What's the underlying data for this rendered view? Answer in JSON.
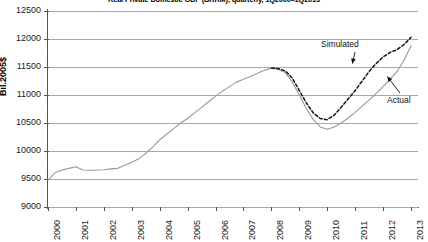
{
  "chart_data": {
    "type": "line",
    "title": "Real Private Domestic GDP (BRRM), quarterly, 1Q2000–1Q2013",
    "xlabel": "",
    "ylabel": "Bil.2005$",
    "ylim": [
      9000,
      12500
    ],
    "xlim": [
      2000,
      2013.25
    ],
    "yticks": [
      9000,
      9500,
      10000,
      10500,
      11000,
      11500,
      12000,
      12500
    ],
    "ytick_labels": [
      "9000",
      "9500",
      "10000",
      "10500",
      "11000",
      "11500",
      "12000",
      "12500"
    ],
    "xticks": [
      2000,
      2001,
      2002,
      2003,
      2004,
      2005,
      2006,
      2007,
      2008,
      2009,
      2010,
      2011,
      2012,
      2013
    ],
    "xtick_labels": [
      "2000",
      "2001",
      "2002",
      "2003",
      "2004",
      "2005",
      "2006",
      "2007",
      "2008",
      "2009",
      "2010",
      "2011",
      "2012",
      "2013"
    ],
    "grid": "horizontal",
    "legend_position": "inline-annotations",
    "annotations": [
      {
        "text": "Simulated",
        "x": 2010.3,
        "y": 12050,
        "points_to": {
          "x": 2010.9,
          "y": 11560
        }
      },
      {
        "text": "Actual",
        "x": 2012.6,
        "y": 10960,
        "points_to": {
          "x": 2012.15,
          "y": 11330
        }
      }
    ],
    "series": [
      {
        "name": "Actual",
        "style": "solid",
        "color": "#9a9a9a",
        "x": [
          2000.0,
          2000.25,
          2000.5,
          2000.75,
          2001.0,
          2001.25,
          2001.5,
          2001.75,
          2002.0,
          2002.25,
          2002.5,
          2002.75,
          2003.0,
          2003.25,
          2003.5,
          2003.75,
          2004.0,
          2004.25,
          2004.5,
          2004.75,
          2005.0,
          2005.25,
          2005.5,
          2005.75,
          2006.0,
          2006.25,
          2006.5,
          2006.75,
          2007.0,
          2007.25,
          2007.5,
          2007.75,
          2008.0,
          2008.25,
          2008.5,
          2008.75,
          2009.0,
          2009.25,
          2009.5,
          2009.75,
          2010.0,
          2010.25,
          2010.5,
          2010.75,
          2011.0,
          2011.25,
          2011.5,
          2011.75,
          2012.0,
          2012.25,
          2012.5,
          2012.75,
          2013.0
        ],
        "values": [
          9480,
          9610,
          9660,
          9690,
          9720,
          9660,
          9655,
          9660,
          9665,
          9680,
          9690,
          9745,
          9800,
          9860,
          9960,
          10070,
          10200,
          10300,
          10400,
          10500,
          10580,
          10680,
          10780,
          10880,
          10980,
          11070,
          11150,
          11230,
          11280,
          11330,
          11390,
          11440,
          11480,
          11460,
          11400,
          11230,
          11000,
          10760,
          10560,
          10430,
          10390,
          10430,
          10500,
          10590,
          10690,
          10800,
          10910,
          11030,
          11150,
          11280,
          11420,
          11620,
          11880
        ]
      },
      {
        "name": "Simulated",
        "style": "dashed",
        "color": "#141414",
        "x": [
          2008.0,
          2008.25,
          2008.5,
          2008.75,
          2009.0,
          2009.25,
          2009.5,
          2009.75,
          2010.0,
          2010.25,
          2010.5,
          2010.75,
          2011.0,
          2011.25,
          2011.5,
          2011.75,
          2012.0,
          2012.25,
          2012.5,
          2012.75,
          2013.0
        ],
        "values": [
          11480,
          11470,
          11430,
          11300,
          11080,
          10860,
          10680,
          10580,
          10560,
          10640,
          10780,
          10930,
          11080,
          11250,
          11420,
          11560,
          11680,
          11760,
          11810,
          11900,
          12030
        ]
      }
    ]
  },
  "colors": {
    "actual_line": "#9a9a9a",
    "simulated_line": "#141414",
    "gridline": "#a9a9a9",
    "axis": "#555555",
    "background": "#ffffff",
    "text": "#1a1a1a"
  }
}
